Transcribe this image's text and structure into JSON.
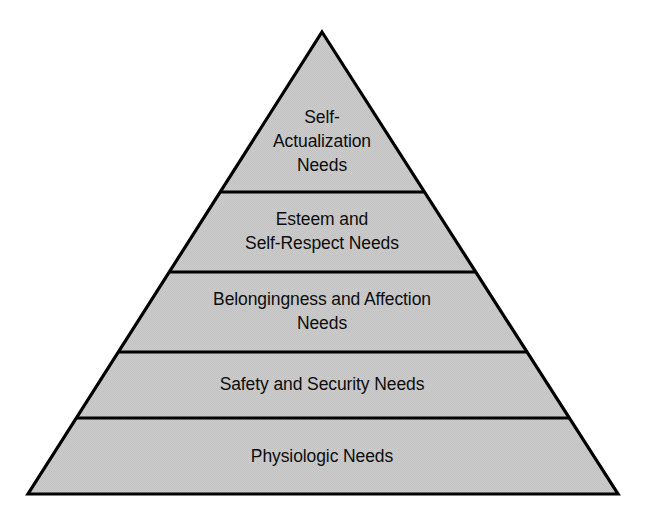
{
  "diagram": {
    "type": "pyramid",
    "background_color": "#ffffff",
    "fill_color": "#c8c8c8",
    "stroke_color": "#000000",
    "text_color": "#0d0d0d",
    "apex": {
      "x": 322,
      "y": 32
    },
    "base_left": {
      "x": 28,
      "y": 494
    },
    "base_right": {
      "x": 618,
      "y": 494
    },
    "divider_y": [
      192,
      272,
      352,
      418
    ],
    "tiers": [
      {
        "index": 1,
        "level": "top",
        "label": "Self-\nActualization\nNeeds",
        "label_x": 322,
        "label_y": 141,
        "top_y": 32,
        "bottom_y": 192
      },
      {
        "index": 2,
        "level": "fourth",
        "label": "Esteem and\nSelf-Respect Needs",
        "label_x": 322,
        "label_y": 231,
        "top_y": 192,
        "bottom_y": 272
      },
      {
        "index": 3,
        "level": "third",
        "label": "Belongingness and Affection\nNeeds",
        "label_x": 322,
        "label_y": 311,
        "top_y": 272,
        "bottom_y": 352
      },
      {
        "index": 4,
        "level": "second",
        "label": "Safety and Security Needs",
        "label_x": 322,
        "label_y": 384,
        "top_y": 352,
        "bottom_y": 418
      },
      {
        "index": 5,
        "level": "base",
        "label": "Physiologic Needs",
        "label_x": 322,
        "label_y": 456,
        "top_y": 418,
        "bottom_y": 494
      }
    ]
  }
}
